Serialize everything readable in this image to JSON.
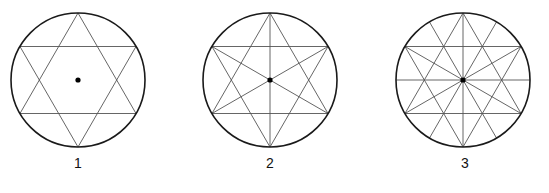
{
  "figures": [
    {
      "label": "1",
      "center": [
        78,
        80
      ],
      "radius": 67,
      "hexagram": true,
      "diameter_angles_deg": [],
      "center_dot": true
    },
    {
      "label": "2",
      "center": [
        270,
        80
      ],
      "radius": 67,
      "hexagram": true,
      "diameter_angles_deg": [
        90,
        30,
        150
      ],
      "center_dot": true
    },
    {
      "label": "3",
      "center": [
        463,
        80
      ],
      "radius": 67,
      "hexagram": true,
      "diameter_angles_deg": [
        0,
        30,
        60,
        90,
        120,
        150
      ],
      "center_dot": true
    }
  ],
  "colors": {
    "circle": "#1a1a1a",
    "lines": "#555555",
    "dot": "#000000",
    "background": "#ffffff"
  }
}
